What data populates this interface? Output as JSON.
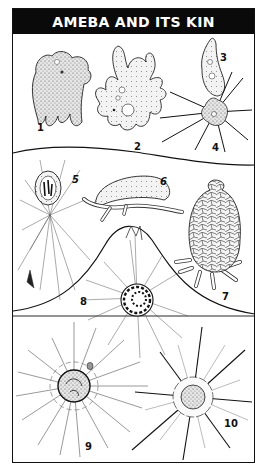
{
  "plate": {
    "title": "AMEBA AND ITS KIN",
    "colors": {
      "header_bg": "#0a0a0a",
      "header_text": "#ffffff",
      "ink": "#111111",
      "paper": "#ffffff"
    }
  },
  "figures": [
    {
      "number": "1",
      "name": "ameba-lobed",
      "x": 37,
      "y": 122
    },
    {
      "number": "2",
      "name": "ameba-branched",
      "x": 134,
      "y": 141
    },
    {
      "number": "3",
      "name": "ameba-small-elongated",
      "x": 220,
      "y": 52
    },
    {
      "number": "4",
      "name": "sun-animalcule-spiky",
      "x": 212,
      "y": 142
    },
    {
      "number": "5",
      "name": "foraminifer-reticulate",
      "x": 72,
      "y": 174
    },
    {
      "number": "6",
      "name": "arcella-shelled",
      "x": 160,
      "y": 176
    },
    {
      "number": "7",
      "name": "difflugia-shelled",
      "x": 222,
      "y": 291
    },
    {
      "number": "8",
      "name": "foraminifer-spiral",
      "x": 80,
      "y": 296
    },
    {
      "number": "9",
      "name": "radiolarian-rayed",
      "x": 85,
      "y": 441
    },
    {
      "number": "10",
      "name": "radiolarian-star",
      "x": 224,
      "y": 418
    }
  ]
}
